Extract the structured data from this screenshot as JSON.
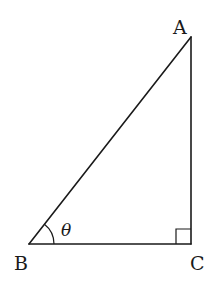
{
  "diagram": {
    "type": "right-triangle",
    "vertices": {
      "A": {
        "label": "A"
      },
      "B": {
        "label": "B"
      },
      "C": {
        "label": "C"
      }
    },
    "angle_label": "θ",
    "angle_at": "B",
    "right_angle_at": "C",
    "colors": {
      "stroke": "#1a1a1a",
      "background": "#ffffff"
    }
  }
}
